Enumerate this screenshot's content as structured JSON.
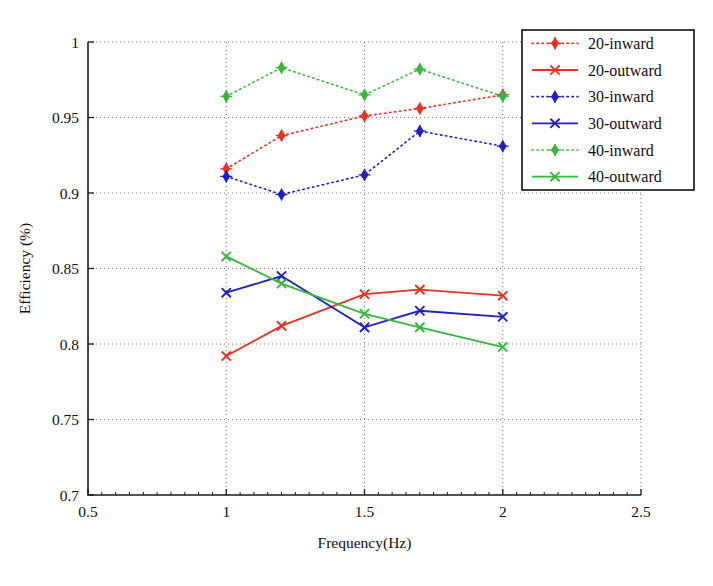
{
  "chart_data": {
    "type": "line",
    "title": "",
    "xlabel": "Frequency(Hz)",
    "ylabel": "Efficiency (%)",
    "xlim": [
      0.5,
      2.5
    ],
    "ylim": [
      0.7,
      1.0
    ],
    "xticks": [
      0.5,
      1,
      1.5,
      2,
      2.5
    ],
    "xticklabels": [
      "0.5",
      "1",
      "1.5",
      "2",
      "2.5"
    ],
    "yticks": [
      0.7,
      0.75,
      0.8,
      0.85,
      0.9,
      0.95,
      1.0
    ],
    "yticklabels": [
      "0.7",
      "0.75",
      "0.8",
      "0.85",
      "0.9",
      "0.95",
      "1"
    ],
    "grid": true,
    "grid_style": "dotted",
    "legend_position": "top-right",
    "x": [
      1.0,
      1.2,
      1.5,
      1.7,
      2.0
    ],
    "series": [
      {
        "name": "20-inward",
        "color": "#ef2f1f",
        "style": "dotted",
        "marker": "diamond",
        "values": [
          0.916,
          0.938,
          0.951,
          0.956,
          0.965
        ]
      },
      {
        "name": "20-outward",
        "color": "#ef2f1f",
        "style": "solid",
        "marker": "x",
        "values": [
          0.792,
          0.812,
          0.833,
          0.836,
          0.832
        ]
      },
      {
        "name": "30-inward",
        "color": "#2020c8",
        "style": "dotted",
        "marker": "diamond",
        "values": [
          0.911,
          0.899,
          0.912,
          0.941,
          0.931
        ]
      },
      {
        "name": "30-outward",
        "color": "#2020c8",
        "style": "solid",
        "marker": "x",
        "values": [
          0.834,
          0.845,
          0.811,
          0.822,
          0.818
        ]
      },
      {
        "name": "40-inward",
        "color": "#34b83a",
        "style": "dotted",
        "marker": "diamond",
        "values": [
          0.964,
          0.983,
          0.965,
          0.982,
          0.964
        ]
      },
      {
        "name": "40-outward",
        "color": "#34b83a",
        "style": "solid",
        "marker": "x",
        "values": [
          0.858,
          0.84,
          0.82,
          0.811,
          0.798
        ]
      }
    ]
  },
  "legend": {
    "items": [
      {
        "label": "20-inward"
      },
      {
        "label": "20-outward"
      },
      {
        "label": "30-inward"
      },
      {
        "label": "30-outward"
      },
      {
        "label": "40-inward"
      },
      {
        "label": "40-outward"
      }
    ]
  },
  "axes": {
    "xlabel": "Frequency(Hz)",
    "ylabel": "Efficiency (%)"
  }
}
